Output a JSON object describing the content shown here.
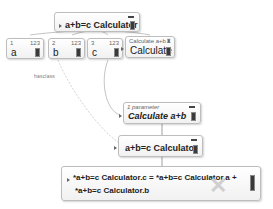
{
  "root_node": {
    "label": "a+b=c Calculator",
    "collapse_icon": "minus-icon"
  },
  "parameter_nodes": [
    {
      "index": "1",
      "type_badge": "123",
      "label": "a"
    },
    {
      "index": "2",
      "type_badge": "123",
      "label": "b"
    },
    {
      "index": "3",
      "type_badge": "123",
      "label": "c"
    }
  ],
  "action_node": {
    "header": "Calculate a+b",
    "header_icon": "trophy-icon",
    "label": "Calculate"
  },
  "edge_label": "hasclass",
  "calc_node": {
    "header": "1 parameter",
    "label": "Calculate a+b"
  },
  "calculator_node": {
    "label": "a+b=c Calculator"
  },
  "formula_node": {
    "line1": "*a+b=c Calculator.c = *a+b=c Calculator.a +",
    "line2": "*a+b=c Calculator.b"
  },
  "colors": {
    "node_border": "#bdbdbd",
    "node_bg": "#f4f4f4",
    "handle": "#3a3a3a",
    "link": "#b5b5b5"
  }
}
